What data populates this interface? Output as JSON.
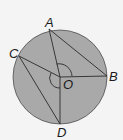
{
  "diagram": {
    "colors": {
      "fill": "#a9a9a9",
      "stroke": "#2a2a2a",
      "background": "#f4f4f4"
    },
    "labels": {
      "A": "A",
      "B": "B",
      "C": "C",
      "D": "D",
      "O": "O"
    }
  }
}
